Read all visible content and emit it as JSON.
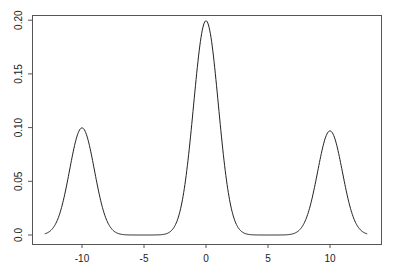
{
  "chart_data": {
    "type": "line",
    "title": "",
    "xlabel": "",
    "ylabel": "",
    "xlim": [
      -14,
      14
    ],
    "ylim": [
      0,
      0.2
    ],
    "grid": false,
    "legend": null,
    "x_ticks": [
      -10,
      -5,
      0,
      5,
      10
    ],
    "x_tick_labels": [
      "-10",
      "-5",
      "0",
      "5",
      "10"
    ],
    "y_ticks": [
      0.0,
      0.05,
      0.1,
      0.15,
      0.2
    ],
    "y_tick_labels": [
      "0.0",
      "0.05",
      "0.10",
      "0.15",
      "0.20"
    ],
    "annotations": [],
    "peaks": [
      {
        "x": -10,
        "y": 0.1
      },
      {
        "x": 0,
        "y": 0.2
      },
      {
        "x": 10,
        "y": 0.097
      }
    ],
    "series": [
      {
        "name": "density",
        "color": "#222222",
        "description": "Mixture density 0.25*N(-10,1) + 0.5*N(0,1) + 0.25*N(10,1)",
        "x": [
          -13,
          -12.5,
          -12,
          -11.5,
          -11,
          -10.5,
          -10,
          -9.5,
          -9,
          -8.5,
          -8,
          -7.5,
          -7,
          -6,
          -5,
          -4,
          -3,
          -2.5,
          -2,
          -1.5,
          -1,
          -0.5,
          0,
          0.5,
          1,
          1.5,
          2,
          2.5,
          3,
          4,
          5,
          6,
          7,
          7.5,
          8,
          8.5,
          9,
          9.5,
          10,
          10.5,
          11,
          11.5,
          12,
          12.5,
          13
        ],
        "y": [
          0.0011,
          0.0044,
          0.0135,
          0.0324,
          0.0605,
          0.088,
          0.0997,
          0.088,
          0.0605,
          0.0324,
          0.0135,
          0.0044,
          0.0011,
          0.0,
          0.0,
          0.0001,
          0.0022,
          0.0088,
          0.027,
          0.0648,
          0.121,
          0.176,
          0.1995,
          0.176,
          0.121,
          0.0648,
          0.027,
          0.0088,
          0.0022,
          0.0001,
          0.0,
          0.0,
          0.0011,
          0.0044,
          0.0135,
          0.0324,
          0.0605,
          0.088,
          0.097,
          0.088,
          0.0605,
          0.0324,
          0.0135,
          0.0044,
          0.0011
        ]
      }
    ]
  },
  "plot_box": {
    "left": 32,
    "top": 15,
    "right": 381,
    "bottom": 244
  },
  "axis_map": {
    "x0_px": 206,
    "px_per_x": 12.4,
    "y0_px": 235,
    "px_per_y": 1074
  }
}
